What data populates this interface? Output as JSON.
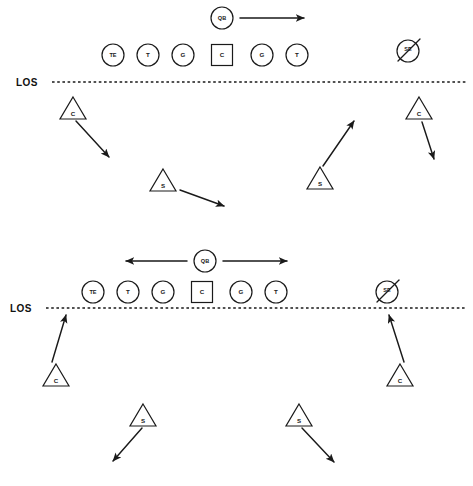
{
  "diagram": {
    "type": "football-formation-diagram",
    "title": "",
    "colors": {
      "ink": "#1a1a1a",
      "background": "#ffffff"
    },
    "los_label": "LOS",
    "footer_note": "",
    "formations": [
      {
        "id": "top-formation",
        "name": "Formation 1 - QB Roll Right",
        "los_label": "LOS",
        "los_y": 82,
        "los_x1": 52,
        "los_x2": 466,
        "los_label_x": 16,
        "los_label_y": 85,
        "offense": [
          {
            "label": "TE",
            "shape": "circle",
            "x": 113,
            "y": 55,
            "r": 11
          },
          {
            "label": "T",
            "shape": "circle",
            "x": 148,
            "y": 55,
            "r": 11
          },
          {
            "label": "G",
            "shape": "circle",
            "x": 183,
            "y": 55,
            "r": 11
          },
          {
            "label": "C",
            "shape": "square",
            "x": 222,
            "y": 55,
            "size": 21
          },
          {
            "label": "G",
            "shape": "circle",
            "x": 262,
            "y": 55,
            "r": 11
          },
          {
            "label": "T",
            "shape": "circle",
            "x": 297,
            "y": 55,
            "r": 11
          },
          {
            "label": "SE",
            "shape": "circle-crossed",
            "x": 408,
            "y": 51,
            "r": 11
          },
          {
            "label": "QB",
            "shape": "circle",
            "x": 222,
            "y": 18,
            "r": 11
          }
        ],
        "defense": [
          {
            "label": "C",
            "shape": "triangle",
            "x": 73,
            "y": 108,
            "size": 15
          },
          {
            "label": "C",
            "shape": "triangle",
            "x": 419,
            "y": 108,
            "size": 15
          },
          {
            "label": "S",
            "shape": "triangle",
            "x": 163,
            "y": 180,
            "size": 15
          },
          {
            "label": "S",
            "shape": "triangle",
            "x": 320,
            "y": 178,
            "size": 15
          }
        ],
        "arrows": [
          {
            "from_label": "QB",
            "x1": 240,
            "y1": 18,
            "x2": 306,
            "y2": 18,
            "head": "end",
            "note": "QB rolls right"
          },
          {
            "from_label": "C-left",
            "x1": 76,
            "y1": 121,
            "x2": 111,
            "y2": 159,
            "head": "end",
            "note": "left corner drops back inside"
          },
          {
            "from_label": "C-right",
            "x1": 422,
            "y1": 122,
            "x2": 435,
            "y2": 161,
            "head": "end",
            "note": "right corner drops back"
          },
          {
            "from_label": "S-left",
            "x1": 178,
            "y1": 188,
            "x2": 225,
            "y2": 206,
            "head": "end",
            "note": "left safety drifts right"
          },
          {
            "from_label": "S-right",
            "x1": 325,
            "y1": 170,
            "x2": 356,
            "y2": 122,
            "head": "end",
            "note": "right safety jumps up"
          }
        ]
      },
      {
        "id": "bottom-formation",
        "name": "Formation 2 - QB Two-Way Option",
        "los_label": "LOS",
        "los_y": 308,
        "los_x1": 46,
        "los_x2": 466,
        "los_label_x": 16,
        "los_label_y": 311,
        "offense": [
          {
            "label": "TE",
            "shape": "circle",
            "x": 93,
            "y": 292,
            "r": 11
          },
          {
            "label": "T",
            "shape": "circle",
            "x": 128,
            "y": 292,
            "r": 11
          },
          {
            "label": "G",
            "shape": "circle",
            "x": 163,
            "y": 292,
            "r": 11
          },
          {
            "label": "C",
            "shape": "square",
            "x": 202,
            "y": 292,
            "size": 21
          },
          {
            "label": "G",
            "shape": "circle",
            "x": 241,
            "y": 292,
            "r": 11
          },
          {
            "label": "T",
            "shape": "circle",
            "x": 276,
            "y": 292,
            "r": 11
          },
          {
            "label": "SE",
            "shape": "circle-crossed",
            "x": 387,
            "y": 292,
            "r": 11
          },
          {
            "label": "QB",
            "shape": "circle",
            "x": 205,
            "y": 261,
            "r": 11
          }
        ],
        "defense": [
          {
            "label": "C",
            "shape": "triangle",
            "x": 56,
            "y": 375,
            "size": 15
          },
          {
            "label": "C",
            "shape": "triangle",
            "x": 400,
            "y": 375,
            "size": 15
          },
          {
            "label": "S",
            "shape": "triangle",
            "x": 143,
            "y": 415,
            "size": 15
          },
          {
            "label": "S",
            "shape": "triangle",
            "x": 299,
            "y": 415,
            "size": 15
          }
        ],
        "arrows": [
          {
            "from_label": "QB-left",
            "x1": 187,
            "y1": 261,
            "x2": 124,
            "y2": 261,
            "head": "end",
            "note": "QB may go left"
          },
          {
            "from_label": "QB-right",
            "x1": 223,
            "y1": 261,
            "x2": 289,
            "y2": 261,
            "head": "end",
            "note": "QB may go right"
          },
          {
            "from_label": "C-left",
            "x1": 51,
            "y1": 364,
            "x2": 66,
            "y2": 316,
            "head": "end",
            "note": "left corner presses up"
          },
          {
            "from_label": "C-right",
            "x1": 405,
            "y1": 364,
            "x2": 388,
            "y2": 316,
            "head": "end",
            "note": "right corner presses up"
          },
          {
            "from_label": "S-left",
            "x1": 142,
            "y1": 428,
            "x2": 111,
            "y2": 463,
            "head": "end",
            "note": "left safety drops outside"
          },
          {
            "from_label": "S-right",
            "x1": 302,
            "y1": 428,
            "x2": 336,
            "y2": 464,
            "head": "end",
            "note": "right safety drops outside"
          }
        ]
      }
    ],
    "legend": {
      "circle": "offensive player",
      "square": "center (ball carrier snap)",
      "triangle": "defensive back",
      "circle-crossed": "player removed / not in play"
    }
  }
}
